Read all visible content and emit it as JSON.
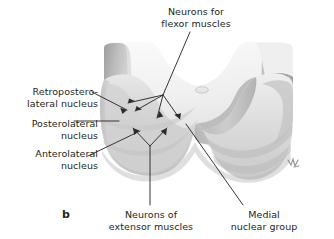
{
  "figure": {
    "panel_letter": "b",
    "background_color": "#ffffff",
    "text_color": "#231f20",
    "leader_line_color": "#2b2b2b",
    "signature": "artist-signature-mark"
  },
  "labels": {
    "flexor": "Neurons for\nflexor muscles",
    "retroposterolateral": "Retropostero-\nlateral nucleus",
    "posterolateral": "Posterolateral\nnucleus",
    "anterolateral": "Anterolateral\nnucleus",
    "extensor": "Neurons of\nextensor muscles",
    "medial": "Medial\nnuclear group"
  },
  "illustration": {
    "fill_light": "#f2f2f2",
    "fill_mid": "#dcdcdc",
    "fill_shadow": "#b9b9b9",
    "fill_dark": "#a6a6a6",
    "edge": "#cfcfcf",
    "central_canal_label": "central-canal"
  }
}
